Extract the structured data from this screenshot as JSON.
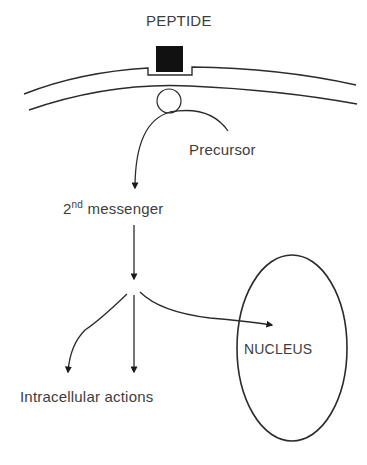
{
  "diagram": {
    "labels": {
      "peptide": "PEPTIDE",
      "precursor": "Precursor",
      "second_messenger_base": "2",
      "second_messenger_sup": "nd",
      "second_messenger_rest": " messenger",
      "nucleus": "NUCLEUS",
      "intracellular_actions": "Intracellular actions"
    },
    "colors": {
      "stroke": "#2b2b2b",
      "receptor_fill": "#111111",
      "text": "#3d3d3d",
      "background": "#ffffff"
    },
    "nodes": [
      {
        "id": "peptide",
        "shape": "filled-square",
        "label": "PEPTIDE"
      },
      {
        "id": "membrane",
        "shape": "double-arc"
      },
      {
        "id": "vesicle",
        "shape": "circle"
      },
      {
        "id": "precursor",
        "shape": "text",
        "label": "Precursor"
      },
      {
        "id": "second_messenger",
        "shape": "text",
        "label": "2nd messenger"
      },
      {
        "id": "nucleus",
        "shape": "ellipse",
        "label": "NUCLEUS"
      },
      {
        "id": "intracellular_actions",
        "shape": "text",
        "label": "Intracellular actions"
      }
    ],
    "edges": [
      {
        "from": "precursor",
        "to": "second_messenger",
        "style": "curved-arrow"
      },
      {
        "from": "second_messenger",
        "to": "branch_point",
        "style": "straight-arrow"
      },
      {
        "from": "branch_point",
        "to": "intracellular_actions",
        "style": "curved-arrow-left"
      },
      {
        "from": "branch_point",
        "to": "intracellular_actions",
        "style": "straight-arrow-down"
      },
      {
        "from": "branch_point",
        "to": "nucleus",
        "style": "curved-arrow-right"
      }
    ]
  }
}
